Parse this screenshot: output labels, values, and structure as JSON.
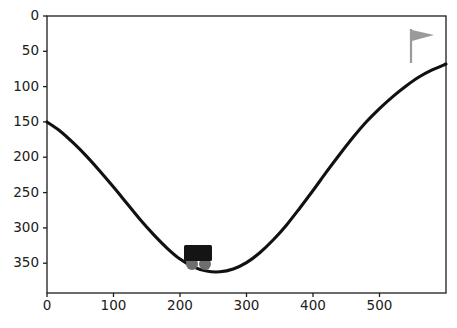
{
  "figure": {
    "title": "",
    "background_color": "#ffffff",
    "width": 457,
    "height": 328
  },
  "axes": {
    "left_px": 47,
    "right_px": 446,
    "top_px": 16,
    "bottom_px": 293,
    "spine_color": "#1c1c1c"
  },
  "chart_data": {
    "type": "line",
    "title": "",
    "xlabel": "",
    "ylabel": "",
    "xlim": [
      0,
      600
    ],
    "ylim": [
      392,
      0
    ],
    "y_axis_inverted": true,
    "grid": false,
    "legend": null,
    "xticks": [
      0,
      100,
      200,
      300,
      400,
      500
    ],
    "xticklabels": [
      "0",
      "100",
      "200",
      "300",
      "400",
      "500"
    ],
    "yticks": [
      0,
      50,
      100,
      150,
      200,
      250,
      300,
      350
    ],
    "yticklabels": [
      "0",
      "50",
      "100",
      "150",
      "200",
      "250",
      "300",
      "350"
    ],
    "series": [
      {
        "name": "mountain-terrain",
        "color": "#111111",
        "linewidth": 3.1,
        "x": [
          0,
          20,
          40,
          60,
          80,
          100,
          120,
          140,
          160,
          180,
          200,
          220,
          240,
          260,
          280,
          300,
          320,
          340,
          360,
          380,
          400,
          420,
          440,
          460,
          480,
          500,
          520,
          540,
          560,
          580,
          600
        ],
        "y": [
          150,
          163,
          180,
          199,
          220,
          242,
          265,
          288,
          309,
          328,
          344,
          355,
          361,
          362,
          358,
          349,
          335,
          317,
          296,
          272,
          247,
          221,
          196,
          172,
          150,
          131,
          114,
          99,
          86,
          76,
          68
        ]
      }
    ],
    "annotations": [
      {
        "name": "car",
        "type": "sprite",
        "x": 218,
        "y": 352,
        "body_color": "#141414",
        "wheel_color": "#6e6e6e"
      },
      {
        "name": "goal-flag",
        "type": "sprite",
        "x": 548,
        "y": 60,
        "pole_color": "#9a9a9a",
        "flag_color": "#9a9a9a"
      }
    ]
  },
  "sprites": {
    "car": {
      "label": "car",
      "body": {
        "x_px": 184,
        "y_px": 245,
        "w_px": 28,
        "h_px": 16,
        "color": "#141414"
      },
      "wheels": [
        {
          "cx_px": 192,
          "cy_px": 264,
          "r_px": 6,
          "color": "#6e6e6e"
        },
        {
          "cx_px": 205,
          "cy_px": 264,
          "r_px": 6,
          "color": "#6e6e6e"
        }
      ]
    },
    "flag": {
      "label": "goal flag",
      "pole": {
        "x_px": 411,
        "y_top_px": 29,
        "y_bottom_px": 63,
        "color": "#9a9a9a",
        "width_px": 2.2
      },
      "pennant": {
        "points_px": "412,30 434,35 412,41",
        "color": "#9a9a9a"
      }
    }
  }
}
